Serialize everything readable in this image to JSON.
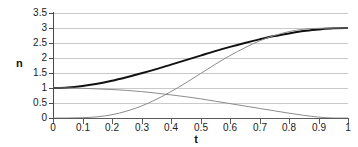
{
  "chart_data": {
    "type": "line",
    "title": "",
    "xlabel": "t",
    "ylabel": "n",
    "xlim": [
      0,
      1
    ],
    "ylim": [
      0,
      3.5
    ],
    "grid": true,
    "grid_axis": "y",
    "legend": "none",
    "xticks": [
      "0",
      "0.1",
      "0.2",
      "0.3",
      "0.4",
      "0.5",
      "0.6",
      "0.7",
      "0.8",
      "0.9",
      "1"
    ],
    "xtick_values": [
      0,
      0.1,
      0.2,
      0.3,
      0.4,
      0.5,
      0.6,
      0.7,
      0.8,
      0.9,
      1
    ],
    "yticks": [
      "0",
      "0.5",
      "1",
      "1.5",
      "2",
      "2.5",
      "3",
      "3.5"
    ],
    "ytick_values": [
      0,
      0.5,
      1,
      1.5,
      2,
      2.5,
      3,
      3.5
    ],
    "x": [
      0,
      0.05,
      0.1,
      0.15,
      0.2,
      0.25,
      0.3,
      0.35,
      0.4,
      0.45,
      0.5,
      0.55,
      0.6,
      0.65,
      0.7,
      0.75,
      0.8,
      0.85,
      0.9,
      0.95,
      1
    ],
    "series": [
      {
        "name": "total",
        "color": "#111111",
        "width": 2.0,
        "values": [
          1.0,
          1.02,
          1.07,
          1.14,
          1.24,
          1.36,
          1.49,
          1.63,
          1.78,
          1.93,
          2.08,
          2.23,
          2.37,
          2.5,
          2.62,
          2.73,
          2.82,
          2.9,
          2.95,
          2.99,
          3.0
        ]
      },
      {
        "name": "decreasing",
        "color": "#8c8c8c",
        "width": 1.0,
        "values": [
          1.0,
          1.0,
          0.99,
          0.97,
          0.95,
          0.92,
          0.88,
          0.83,
          0.77,
          0.71,
          0.64,
          0.56,
          0.48,
          0.4,
          0.32,
          0.24,
          0.16,
          0.09,
          0.03,
          0.0,
          0.0
        ]
      },
      {
        "name": "increasing",
        "color": "#8c8c8c",
        "width": 1.0,
        "values": [
          0.0,
          0.0,
          0.01,
          0.04,
          0.11,
          0.23,
          0.4,
          0.62,
          0.88,
          1.17,
          1.48,
          1.79,
          2.08,
          2.34,
          2.57,
          2.75,
          2.88,
          2.96,
          2.99,
          3.0,
          3.0
        ]
      }
    ]
  }
}
